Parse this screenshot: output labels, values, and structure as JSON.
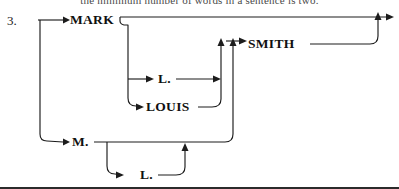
{
  "page": {
    "item_number": "3.",
    "clipped_header_text": "the minimum number of words in a sentence is two."
  },
  "diagram": {
    "type": "railroad-syntax-diagram",
    "stroke_color": "#1c1c1c",
    "background_color": "#ffffff",
    "nodes": [
      {
        "id": "mark",
        "label": "MARK",
        "x": 70,
        "y": 20,
        "branch": "upper-first-name"
      },
      {
        "id": "smith",
        "label": "SMITH",
        "x": 248,
        "y": 44,
        "branch": "surname"
      },
      {
        "id": "l1",
        "label": "L.",
        "x": 160,
        "y": 79,
        "branch": "middle-initial"
      },
      {
        "id": "louis",
        "label": "LOUIS",
        "x": 149,
        "y": 107,
        "branch": "middle-name"
      },
      {
        "id": "m",
        "label": "M.",
        "x": 74,
        "y": 143,
        "branch": "lower-first-initial"
      },
      {
        "id": "l2",
        "label": "L.",
        "x": 142,
        "y": 175,
        "branch": "lower-middle-initial"
      }
    ],
    "arrows": [
      {
        "id": "to-mark",
        "points_to": "mark",
        "direction": "right"
      },
      {
        "id": "to-m",
        "points_to": "m",
        "direction": "right"
      },
      {
        "id": "to-l1",
        "points_to": "l1",
        "direction": "right"
      },
      {
        "id": "to-louis",
        "points_to": "louis",
        "direction": "right"
      },
      {
        "id": "to-l2",
        "points_to": "l2",
        "direction": "right"
      },
      {
        "id": "l1-join",
        "points_to": "middle-join",
        "direction": "right"
      },
      {
        "id": "middle-into-smith",
        "points_to": "smith",
        "direction": "up"
      },
      {
        "id": "lower-into-smith",
        "points_to": "smith",
        "direction": "up"
      },
      {
        "id": "to-smith",
        "points_to": "smith",
        "direction": "right"
      },
      {
        "id": "l2-join",
        "points_to": "lower-join",
        "direction": "up"
      },
      {
        "id": "exit",
        "points_to": "output",
        "direction": "right"
      }
    ]
  }
}
